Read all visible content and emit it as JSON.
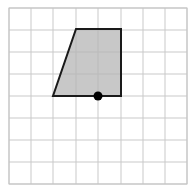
{
  "figure": {
    "type": "coordinate-grid-polygon",
    "title": "",
    "background_color": "#ffffff",
    "canvas": {
      "width": 191,
      "height": 188
    },
    "grid": {
      "name": "square-grid",
      "columns": 8,
      "rows": 8,
      "cell_size": 22,
      "origin_x": 9,
      "origin_y": 30,
      "x_lines": [
        9,
        31,
        53,
        76,
        98,
        121,
        143,
        165,
        187
      ],
      "y_lines": [
        8,
        30,
        52,
        74,
        96,
        118,
        140,
        162,
        184
      ],
      "line_color": "#c9c9c9",
      "line_width": 1,
      "border_color": "#c4c4c4",
      "border_width": 1,
      "visible": true
    },
    "shape": {
      "name": "shaded-quadrilateral",
      "kind": "trapezoid",
      "vertex_count": 4,
      "fill_color": "#b5b5b5",
      "fill_opacity": 0.75,
      "stroke_color": "#1a1a1a",
      "stroke_width": 2,
      "vertices_px": [
        {
          "label": "top-left",
          "x": 76,
          "y": 29
        },
        {
          "label": "top-right",
          "x": 121,
          "y": 29
        },
        {
          "label": "bottom-right",
          "x": 121,
          "y": 96
        },
        {
          "label": "bottom-left",
          "x": 53,
          "y": 96
        }
      ],
      "vertices_grid": [
        {
          "label": "top-left",
          "col": 3,
          "row": 1
        },
        {
          "label": "top-right",
          "col": 5,
          "row": 1
        },
        {
          "label": "bottom-right",
          "col": 5,
          "row": 4
        },
        {
          "label": "bottom-left",
          "col": 2,
          "row": 4
        }
      ],
      "points_attr": "76,29 121,29 121,96 53,96"
    },
    "marker": {
      "name": "marked-point",
      "shape": "filled-circle",
      "x": 98,
      "y": 96,
      "grid_col": 4,
      "grid_row": 4,
      "radius": 4.5,
      "fill_color": "#000000",
      "label": ""
    }
  }
}
